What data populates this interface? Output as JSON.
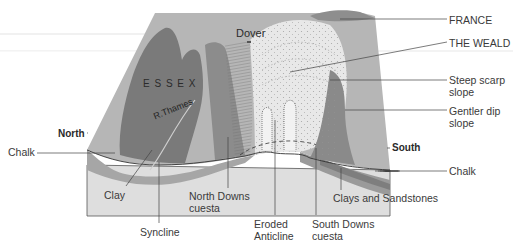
{
  "map_labels": {
    "essex": "E S S E X",
    "dover": "Dover",
    "thames": "R.Thames"
  },
  "directions": {
    "north": "North",
    "south": "South"
  },
  "right_labels": {
    "france": "FRANCE",
    "weald": "THE WEALD",
    "scarp_1": "Steep scarp",
    "scarp_2": "slope",
    "dip_1": "Gentler dip",
    "dip_2": "slope",
    "chalk": "Chalk"
  },
  "left_labels": {
    "chalk": "Chalk"
  },
  "bottom_labels": {
    "clay": "Clay",
    "syncline": "Syncline",
    "north_downs_1": "North Downs",
    "north_downs_2": "cuesta",
    "eroded_1": "Eroded",
    "eroded_2": "Anticline",
    "south_downs_1": "South Downs",
    "south_downs_2": "cuesta",
    "clays_sandstones": "Clays and Sandstones"
  },
  "colors": {
    "chalk_surface": "#b4b4b4",
    "clay_dark": "#7c7c7c",
    "scarp_dark": "#8a8a8a",
    "weald_light": "#e6e6e6",
    "section_light": "#dcdcdc",
    "chalk_band": "#a8a8a8",
    "leader": "#444444"
  }
}
